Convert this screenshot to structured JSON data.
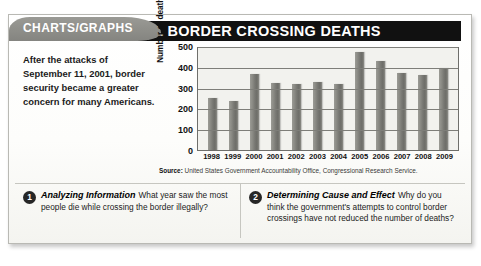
{
  "tab": {
    "label": "CHARTS/GRAPHS"
  },
  "header": {
    "title": "ILLEGAL BORDER CROSSING DEATHS"
  },
  "intro": {
    "text": "After the attacks of September 11, 2001, border security became a greater concern for many Americans."
  },
  "source": {
    "prefix": "Source:",
    "text": "United States Government Accountability Office, Congressional Research Service."
  },
  "questions": [
    {
      "number": "1",
      "title": "Analyzing Information",
      "text": "What year saw the most people die while crossing the border illegally?"
    },
    {
      "number": "2",
      "title": "Determining Cause and Effect",
      "text": "Why do you think the government's attempts to control border crossings have not reduced the number of deaths?"
    }
  ],
  "chart_data": {
    "type": "bar",
    "title": "ILLEGAL BORDER CROSSING DEATHS",
    "xlabel": "",
    "ylabel": "Number of deaths",
    "categories": [
      "1998",
      "1999",
      "2000",
      "2001",
      "2002",
      "2003",
      "2004",
      "2005",
      "2006",
      "2007",
      "2008",
      "2009"
    ],
    "values": [
      250,
      235,
      365,
      320,
      315,
      325,
      315,
      470,
      430,
      370,
      360,
      395
    ],
    "ylim": [
      0,
      500
    ],
    "yticks": [
      0,
      100,
      200,
      300,
      400,
      500
    ],
    "grid": true,
    "legend": "none",
    "bar_color": "#7a7a75"
  }
}
